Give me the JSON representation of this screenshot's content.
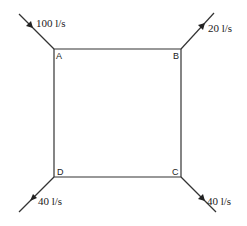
{
  "diagram": {
    "type": "pipe-network-loop",
    "nodes": {
      "A": {
        "label": "A"
      },
      "B": {
        "label": "B"
      },
      "C": {
        "label": "C"
      },
      "D": {
        "label": "D"
      }
    },
    "flows": {
      "A": {
        "label": "100 l/s",
        "direction": "inflow"
      },
      "B": {
        "label": "20 l/s",
        "direction": "outflow"
      },
      "C": {
        "label": "40 l/s",
        "direction": "outflow"
      },
      "D": {
        "label": "40 l/s",
        "direction": "outflow"
      }
    },
    "colors": {
      "line": "#333333",
      "text": "#222222",
      "background": "#ffffff"
    }
  }
}
